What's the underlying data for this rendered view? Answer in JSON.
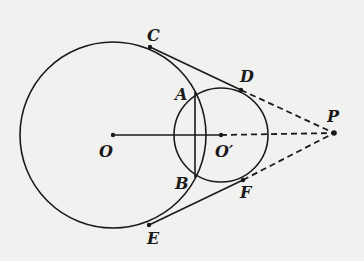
{
  "diagram": {
    "type": "geometry",
    "colors": {
      "ink": "#1a1a1a",
      "background": "#f1f1ef"
    },
    "points": {
      "O": {
        "label": "O",
        "x": 113,
        "y": 135
      },
      "O2": {
        "label": "O′",
        "x": 221,
        "y": 135
      },
      "A": {
        "label": "A",
        "x": 195,
        "y": 97
      },
      "B": {
        "label": "B",
        "x": 195,
        "y": 173
      },
      "C": {
        "label": "C",
        "x": 150,
        "y": 47
      },
      "D": {
        "label": "D",
        "x": 241,
        "y": 90
      },
      "E": {
        "label": "E",
        "x": 149,
        "y": 225
      },
      "F": {
        "label": "F",
        "x": 243,
        "y": 180
      },
      "P": {
        "label": "P",
        "x": 334,
        "y": 133
      }
    },
    "circles": [
      {
        "name": "circle-O",
        "center": "O",
        "r": 93
      },
      {
        "name": "circle-O2",
        "center": "O2",
        "r": 47
      }
    ],
    "segments": [
      {
        "from": "O",
        "to": "O2",
        "style": "solid"
      },
      {
        "from": "O2",
        "to": "P",
        "style": "dashed"
      },
      {
        "from": "A",
        "to": "B",
        "style": "solid"
      },
      {
        "from": "C",
        "to": "D",
        "style": "solid"
      },
      {
        "from": "D",
        "to": "P",
        "style": "dashed"
      },
      {
        "from": "E",
        "to": "F",
        "style": "solid"
      },
      {
        "from": "F",
        "to": "P",
        "style": "dashed"
      }
    ]
  }
}
